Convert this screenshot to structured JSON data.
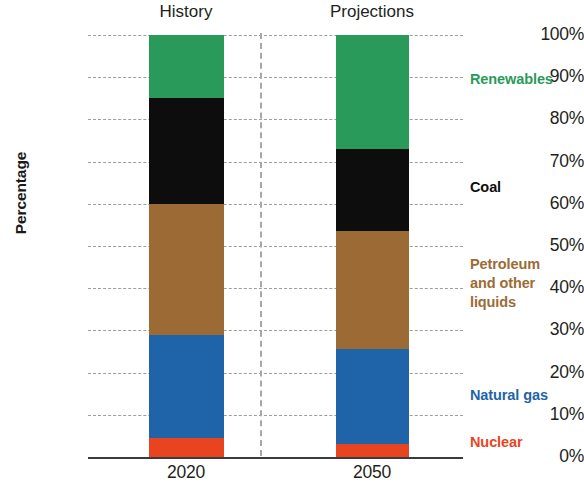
{
  "chart_data": {
    "type": "bar",
    "subtype": "stacked-percentage-column",
    "title": "",
    "xlabel": "",
    "ylabel": "Percentage",
    "categories": [
      "2020",
      "2050"
    ],
    "ylim": [
      0,
      100
    ],
    "ytick_labels": [
      "0%",
      "10%",
      "20%",
      "30%",
      "40%",
      "50%",
      "60%",
      "70%",
      "80%",
      "90%",
      "100%"
    ],
    "ytick_values": [
      0,
      10,
      20,
      30,
      40,
      50,
      60,
      70,
      80,
      90,
      100
    ],
    "grid": true,
    "legend_position": "right-inline",
    "period_labels": [
      "History",
      "Projections"
    ],
    "series": [
      {
        "name": "Nuclear",
        "color": "#e8441f",
        "values": [
          4.5,
          3.0
        ],
        "label_text": "Nuclear"
      },
      {
        "name": "Natural gas",
        "color": "#1f63a8",
        "values": [
          24.5,
          22.5
        ],
        "label_text": "Natural gas"
      },
      {
        "name": "Petroleum and other liquids",
        "color": "#9c6b35",
        "values": [
          31.0,
          28.0
        ],
        "label_text": "Petroleum\nand other\nliquids"
      },
      {
        "name": "Coal",
        "color": "#0d0d0d",
        "values": [
          25.0,
          19.5
        ],
        "label_text": "Coal"
      },
      {
        "name": "Renewables",
        "color": "#2a9a5b",
        "values": [
          15.0,
          27.0
        ],
        "label_text": "Renewables"
      }
    ]
  },
  "axis": {
    "title": "Percentage"
  },
  "colors": {
    "nuclear": "#e8441f",
    "natural_gas": "#1f63a8",
    "petroleum": "#9c6b35",
    "coal": "#0d0d0d",
    "renewables": "#2a9a5b",
    "gridline": "#8e8e8e",
    "axis_line": "#3b3b3b",
    "divider": "#a7a7a7",
    "text": "#231f20"
  }
}
